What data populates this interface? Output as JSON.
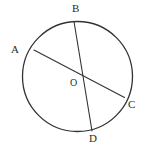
{
  "figure": {
    "kind": "circle-with-chords-diagram",
    "width": 145,
    "height": 150,
    "background_color": "#ffffff",
    "stroke_color": "#333333",
    "label_color": "#2b2b2b"
  },
  "circle": {
    "name": "main-circle",
    "center_x": 77.5,
    "center_y": 76.5,
    "radius": 55,
    "stroke_width": 1.3,
    "fill": "none"
  },
  "segments": [
    {
      "name": "chord-ac",
      "from_label": "A",
      "to_label": "C",
      "x1": 34,
      "y1": 50,
      "x2": 124.5,
      "y2": 97.5,
      "stroke_width": 1.1
    },
    {
      "name": "diameter-bd",
      "from_label": "B",
      "to_label": "D",
      "x1": 74,
      "y1": 21.5,
      "x2": 92,
      "y2": 131,
      "stroke_width": 1.1
    }
  ],
  "labels": [
    {
      "id": "A",
      "text": "A",
      "x": 11,
      "y": 44,
      "role": "chord-endpoint"
    },
    {
      "id": "B",
      "text": "B",
      "x": 72,
      "y": 3,
      "role": "diameter-endpoint"
    },
    {
      "id": "C",
      "text": "C",
      "x": 128,
      "y": 99,
      "role": "chord-endpoint"
    },
    {
      "id": "D",
      "text": "D",
      "x": 89,
      "y": 133,
      "role": "diameter-endpoint"
    },
    {
      "id": "O",
      "text": "O",
      "x": 70,
      "y": 77,
      "role": "center-point"
    }
  ]
}
